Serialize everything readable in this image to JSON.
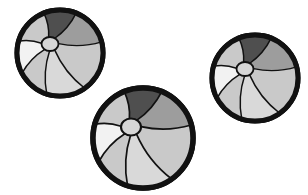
{
  "image": {
    "title": "Three Beach Balls",
    "subject": "beach-ball",
    "count": 3,
    "style": "grayscale-clipart",
    "background_color": "#ffffff",
    "width": 308,
    "height": 195
  },
  "palette": {
    "outline": "#111111",
    "panel_dark": "#4f4f4f",
    "panel_mid_dark": "#7e7e7e",
    "panel_mid": "#9d9d9d",
    "panel_light": "#c9c9c9",
    "panel_lighter": "#d9d9d9",
    "panel_lightest": "#f2f2f2",
    "hub_fill": "#d6d6d6",
    "background": "#ffffff"
  },
  "balls": [
    {
      "name": "ball-top-left",
      "label": "Beach ball 1",
      "cx": 60,
      "cy": 53,
      "r": 43,
      "rim_width": 5,
      "hub_cx": 50,
      "hub_cy": 44,
      "hub_rx": 8.5,
      "hub_ry": 7
    },
    {
      "name": "ball-center-bottom",
      "label": "Beach ball 2",
      "cx": 143,
      "cy": 138,
      "r": 50,
      "rim_width": 5.5,
      "hub_cx": 131,
      "hub_cy": 127,
      "hub_rx": 10,
      "hub_ry": 8.5
    },
    {
      "name": "ball-right",
      "label": "Beach ball 3",
      "cx": 255,
      "cy": 78,
      "r": 43,
      "rim_width": 5,
      "hub_cx": 245,
      "hub_cy": 69,
      "hub_rx": 8.5,
      "hub_ry": 7
    }
  ],
  "panels": [
    {
      "name": "panel-top-dark",
      "tone": "panel_dark",
      "a0": 248,
      "a1": 292
    },
    {
      "name": "panel-upper-right",
      "tone": "panel_mid",
      "a0": 292,
      "a1": 345
    },
    {
      "name": "panel-right",
      "tone": "panel_light",
      "a0": 345,
      "a1": 55
    },
    {
      "name": "panel-lower-right",
      "tone": "panel_lighter",
      "a0": 55,
      "a1": 108
    },
    {
      "name": "panel-bottom-left",
      "tone": "panel_light",
      "a0": 108,
      "a1": 152
    },
    {
      "name": "panel-left-white",
      "tone": "panel_lightest",
      "a0": 152,
      "a1": 196
    },
    {
      "name": "panel-upper-left",
      "tone": "panel_light",
      "a0": 196,
      "a1": 248
    }
  ]
}
